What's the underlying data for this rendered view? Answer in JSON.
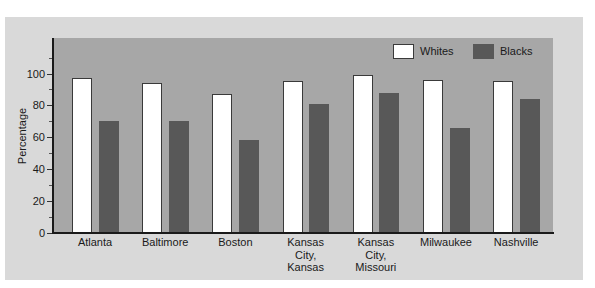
{
  "chart_data": {
    "type": "bar",
    "title": "",
    "xlabel": "",
    "ylabel": "Percentage",
    "ylim": [
      0,
      120
    ],
    "yticks": [
      0,
      20,
      40,
      60,
      80,
      100
    ],
    "grid": false,
    "legend_position": "top-right",
    "categories": [
      "Atlanta",
      "Baltimore",
      "Boston",
      "Kansas\nCity,\nKansas",
      "Kansas\nCity,\nMissouri",
      "Milwaukee",
      "Nashville"
    ],
    "series": [
      {
        "name": "Whites",
        "color": "#ffffff",
        "values": [
          97,
          94,
          87,
          95,
          99,
          96,
          95
        ]
      },
      {
        "name": "Blacks",
        "color": "#585858",
        "values": [
          70,
          70,
          58,
          81,
          88,
          66,
          84
        ]
      }
    ]
  },
  "colors": {
    "panel_background": "#d9d9d9",
    "plot_background": "#a7a7a7",
    "whites_bar": "#ffffff",
    "blacks_bar": "#585858",
    "axis": "#1a1a1a"
  }
}
